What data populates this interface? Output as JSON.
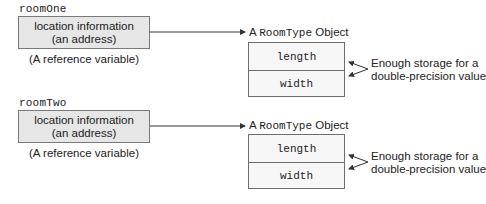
{
  "diagram": {
    "references": [
      {
        "variable_name": "roomOne",
        "box_line1": "location information",
        "box_line2": "(an address)",
        "caption": "(A reference variable)"
      },
      {
        "variable_name": "roomTwo",
        "box_line1": "location information",
        "box_line2": "(an address)",
        "caption": "(A reference variable)"
      }
    ],
    "objects": [
      {
        "title_prefix": "A",
        "title_type": "RoomType",
        "title_suffix": "Object",
        "fields": [
          "length",
          "width"
        ],
        "note_line1": "Enough storage for a",
        "note_line2": "double-precision value"
      },
      {
        "title_prefix": "A",
        "title_type": "RoomType",
        "title_suffix": "Object",
        "fields": [
          "length",
          "width"
        ],
        "note_line1": "Enough storage for a",
        "note_line2": "double-precision value"
      }
    ],
    "colors": {
      "reference_box_fill": "#e6e6e6",
      "border": "#6e6e6e",
      "arrow": "#333333"
    }
  }
}
